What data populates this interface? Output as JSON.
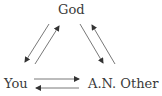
{
  "diagram": {
    "nodes": {
      "god": "God",
      "you": "You",
      "other": "A.N. Other"
    },
    "edges": [
      {
        "from": "God",
        "to": "You"
      },
      {
        "from": "You",
        "to": "God"
      },
      {
        "from": "God",
        "to": "A.N. Other"
      },
      {
        "from": "A.N. Other",
        "to": "God"
      },
      {
        "from": "You",
        "to": "A.N. Other"
      },
      {
        "from": "A.N. Other",
        "to": "You"
      }
    ],
    "colors": {
      "line": "#444444",
      "text": "#3a3a3a"
    }
  }
}
